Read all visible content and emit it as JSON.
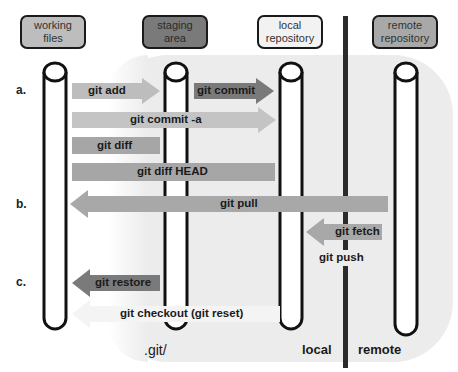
{
  "headers": [
    {
      "id": "working",
      "label_line1": "working",
      "label_line2": "files",
      "fill": "#bdbdbd"
    },
    {
      "id": "staging",
      "label_line1": "staging",
      "label_line2": "area",
      "fill": "#7a7a7a"
    },
    {
      "id": "local",
      "label_line1": "local",
      "label_line2": "repository",
      "fill": "#f2f2f2"
    },
    {
      "id": "remote",
      "label_line1": "remote",
      "label_line2": "repository",
      "fill": "#a8a8a8"
    }
  ],
  "row_labels": [
    "a.",
    "b.",
    "c."
  ],
  "commands": [
    {
      "id": "git-add",
      "label": "git add",
      "color": "#bdbdbd",
      "direction": "right"
    },
    {
      "id": "git-commit",
      "label": "git commit",
      "color": "#7a7a7a",
      "direction": "right"
    },
    {
      "id": "git-commit-a",
      "label": "git commit -a",
      "color": "#c4c4c4",
      "direction": "right"
    },
    {
      "id": "git-diff",
      "label": "git diff",
      "color": "#a6a6a6",
      "direction": "none"
    },
    {
      "id": "git-diff-head",
      "label": "git diff HEAD",
      "color": "#a6a6a6",
      "direction": "none"
    },
    {
      "id": "git-pull",
      "label": "git pull",
      "color": "#a8a8a8",
      "direction": "left"
    },
    {
      "id": "git-fetch",
      "label": "git fetch",
      "color": "#a8a8a8",
      "direction": "left"
    },
    {
      "id": "git-push",
      "label": "git push",
      "color": "#ffffff",
      "direction": "right"
    },
    {
      "id": "git-restore",
      "label": "git restore",
      "color": "#7a7a7a",
      "direction": "left"
    },
    {
      "id": "git-checkout",
      "label": "git checkout (git reset)",
      "color": "#f4f4f4",
      "direction": "left"
    }
  ],
  "zones": {
    "git_dir": ".git/",
    "local": "local",
    "remote": "remote"
  },
  "colors": {
    "panel": "#ececec",
    "divider": "#2b2b2b",
    "outline": "#111111"
  }
}
